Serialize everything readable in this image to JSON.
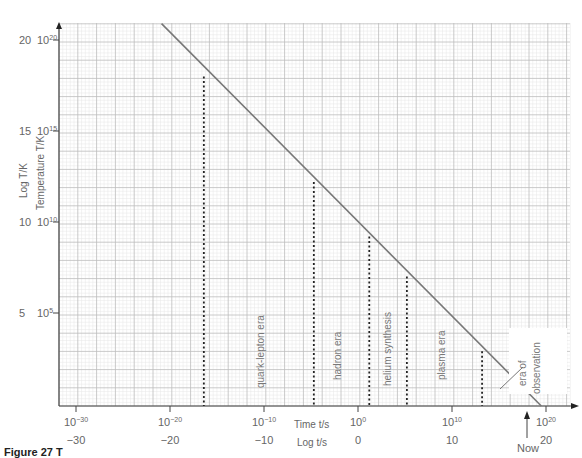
{
  "chart_data": {
    "type": "line",
    "title": "",
    "xlabel_top": "Time t/s",
    "xlabel_bottom": "Log t/s",
    "ylabel_outer": "Log T/K",
    "ylabel_inner": "Temperature T/K",
    "x_ticks": [
      {
        "log": -30,
        "label": "10",
        "exp": "−30",
        "log_label": "−30"
      },
      {
        "log": -20,
        "label": "10",
        "exp": "−20",
        "log_label": "−20"
      },
      {
        "log": -10,
        "label": "10",
        "exp": "−10",
        "log_label": "−10"
      },
      {
        "log": 0,
        "label": "10",
        "exp": "0",
        "log_label": "0"
      },
      {
        "log": 10,
        "label": "10",
        "exp": "10",
        "log_label": "10"
      },
      {
        "log": 20,
        "label": "10",
        "exp": "20",
        "log_label": "20"
      }
    ],
    "y_ticks": [
      {
        "log": 20,
        "label": "10",
        "exp": "20",
        "log_label": "20"
      },
      {
        "log": 15,
        "label": "10",
        "exp": "15",
        "log_label": "15"
      },
      {
        "log": 10,
        "label": "10",
        "exp": "10",
        "log_label": "10"
      },
      {
        "log": 5,
        "label": "10",
        "exp": "5",
        "log_label": "5"
      }
    ],
    "xlim": [
      -32,
      23
    ],
    "ylim": [
      0,
      21
    ],
    "grid": true,
    "series": [
      {
        "name": "Temperature vs time",
        "x": [
          -20.9,
          19.5
        ],
        "y": [
          20.9,
          0
        ]
      }
    ],
    "boundaries": [
      {
        "log_t": -16.4,
        "log_T": 18.0
      },
      {
        "log_t": -4.7,
        "log_T": 12.2
      },
      {
        "log_t": 1.2,
        "log_T": 9.2
      },
      {
        "log_t": 5.2,
        "log_T": 7.0
      },
      {
        "log_t": 13.2,
        "log_T": 2.9
      }
    ],
    "eras": [
      {
        "label": "quark-lepton era",
        "log_t": -10.5
      },
      {
        "label": "hadron era",
        "log_t": -2.5
      },
      {
        "label": "helium synthesis",
        "log_t": 3.4
      },
      {
        "label": "plasma era",
        "log_t": 9.2
      },
      {
        "label": "era of observation",
        "log_t": 17.5
      }
    ],
    "annotations": [
      {
        "text": "Now",
        "log_t": 18
      }
    ]
  },
  "labels": {
    "time_axis": "Time t/s",
    "log_time_axis": "Log t/s",
    "log_temp_axis": "Log T/K",
    "temp_axis": "Temperature T/K",
    "now": "Now",
    "era_quark": "quark-lepton era",
    "era_hadron": "hadron era",
    "era_helium": "helium synthesis",
    "era_plasma": "plasma era",
    "era_obs_1": "era of",
    "era_obs_2": "observation",
    "caption": "Figure 27  T"
  }
}
